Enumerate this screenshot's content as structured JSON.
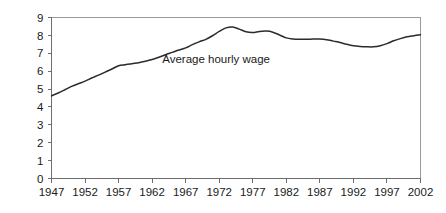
{
  "chart_data": {
    "type": "line",
    "title": "",
    "subtitle": "",
    "xlabel": "",
    "ylabel": "",
    "xlim": [
      1947,
      2002
    ],
    "ylim": [
      0,
      9
    ],
    "grid": false,
    "legend": "none",
    "annotations": [
      {
        "name": "series-label",
        "text": "Average hourly wage",
        "x": 1963.5,
        "y": 6.45
      }
    ],
    "y_ticks": [
      0,
      1,
      2,
      3,
      4,
      5,
      6,
      7,
      8,
      9
    ],
    "y_tick_labels": [
      "0",
      "1",
      "2",
      "3",
      "4",
      "5",
      "6",
      "7",
      "8",
      "9"
    ],
    "x_ticks": [
      1947,
      1952,
      1957,
      1962,
      1967,
      1972,
      1977,
      1982,
      1987,
      1992,
      1997,
      2002
    ],
    "x_tick_labels": [
      "1947",
      "1952",
      "1957",
      "1962",
      "1967",
      "1972",
      "1977",
      "1982",
      "1987",
      "1992",
      "1997",
      "2002"
    ],
    "series": [
      {
        "name": "Average hourly wage",
        "color": "#2b2b2b",
        "x": [
          1947,
          1948,
          1949,
          1950,
          1951,
          1952,
          1953,
          1954,
          1955,
          1956,
          1957,
          1958,
          1959,
          1960,
          1961,
          1962,
          1963,
          1964,
          1965,
          1966,
          1967,
          1968,
          1969,
          1970,
          1971,
          1972,
          1973,
          1974,
          1975,
          1976,
          1977,
          1978,
          1979,
          1980,
          1981,
          1982,
          1983,
          1984,
          1985,
          1986,
          1987,
          1988,
          1989,
          1990,
          1991,
          1992,
          1993,
          1994,
          1995,
          1996,
          1997,
          1998,
          1999,
          2000,
          2001,
          2002
        ],
        "y": [
          4.62,
          4.78,
          4.96,
          5.15,
          5.3,
          5.44,
          5.62,
          5.78,
          5.95,
          6.12,
          6.3,
          6.36,
          6.42,
          6.47,
          6.55,
          6.65,
          6.78,
          6.92,
          7.05,
          7.18,
          7.3,
          7.48,
          7.64,
          7.78,
          7.98,
          8.22,
          8.42,
          8.47,
          8.35,
          8.2,
          8.16,
          8.22,
          8.24,
          8.18,
          8.02,
          7.86,
          7.8,
          7.78,
          7.78,
          7.8,
          7.8,
          7.76,
          7.68,
          7.6,
          7.5,
          7.42,
          7.38,
          7.36,
          7.36,
          7.42,
          7.54,
          7.7,
          7.82,
          7.92,
          7.98,
          8.04
        ]
      }
    ],
    "colors": {
      "series": "#2b2b2b",
      "axis": "#6e6e6e",
      "frame": "#9a9a9a",
      "text": "#1a1a1a",
      "background": "#ffffff"
    }
  }
}
